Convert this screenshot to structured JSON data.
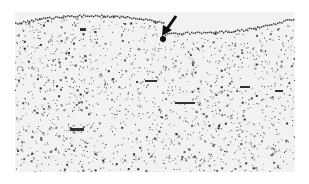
{
  "figure": {
    "type": "micrograph",
    "annotation": {
      "kind": "arrow",
      "direction": "down-left",
      "color": "#111111"
    },
    "colors": {
      "background": "#ffffff",
      "tissue": "#f2f2f2",
      "stain": "#333333"
    }
  }
}
